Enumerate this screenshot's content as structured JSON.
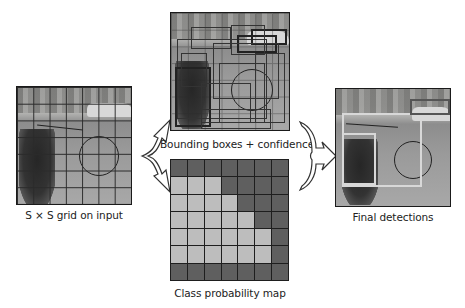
{
  "diagram": {
    "input": {
      "label": "S × S grid on input",
      "grid_size": 7
    },
    "bounding_boxes": {
      "label": "Bounding boxes + confidence"
    },
    "class_map": {
      "label": "Class probability map",
      "grid_size": 7,
      "colors": {
        "dark": "#5f5f5f",
        "light": "#bdbdbd"
      },
      "cells": [
        [
          "D",
          "D",
          "D",
          "D",
          "D",
          "D",
          "D"
        ],
        [
          "L",
          "L",
          "L",
          "D",
          "D",
          "D",
          "D"
        ],
        [
          "L",
          "L",
          "L",
          "L",
          "D",
          "D",
          "D"
        ],
        [
          "L",
          "L",
          "L",
          "L",
          "L",
          "D",
          "D"
        ],
        [
          "L",
          "L",
          "L",
          "L",
          "L",
          "L",
          "D"
        ],
        [
          "L",
          "L",
          "L",
          "L",
          "L",
          "L",
          "D"
        ],
        [
          "D",
          "D",
          "D",
          "D",
          "D",
          "D",
          "D"
        ]
      ]
    },
    "output": {
      "label": "Final detections"
    }
  }
}
